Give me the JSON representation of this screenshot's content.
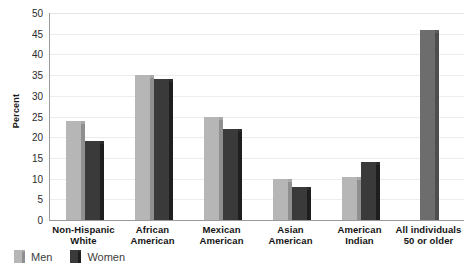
{
  "chart_data": {
    "type": "bar",
    "title": "",
    "xlabel": "",
    "ylabel": "Percent",
    "ylim": [
      0,
      50
    ],
    "yticks": [
      50,
      45,
      40,
      35,
      30,
      25,
      20,
      15,
      10,
      5,
      0
    ],
    "grid": true,
    "legend_position": "bottom-left",
    "categories": [
      "Non-Hispanic\nWhite",
      "African\nAmerican",
      "Mexican\nAmerican",
      "Asian\nAmerican",
      "American\nIndian",
      "All individuals\n50 or older"
    ],
    "category_lines": [
      [
        "Non-Hispanic",
        "White"
      ],
      [
        "African",
        "American"
      ],
      [
        "Mexican",
        "American"
      ],
      [
        "Asian",
        "American"
      ],
      [
        "American",
        "Indian"
      ],
      [
        "All individuals",
        "50 or older"
      ]
    ],
    "series": [
      {
        "name": "Men",
        "color": "#b6b6b6",
        "values": [
          24,
          35,
          25,
          10,
          10.5,
          null
        ]
      },
      {
        "name": "Women",
        "color": "#3a3a3a",
        "values": [
          19,
          34,
          22,
          8,
          14,
          null
        ]
      },
      {
        "name": "All",
        "color": "#6d6d6d",
        "values": [
          null,
          null,
          null,
          null,
          null,
          46
        ]
      }
    ],
    "legend": [
      {
        "label": "Men",
        "color": "#b6b6b6"
      },
      {
        "label": "Women",
        "color": "#3a3a3a"
      }
    ],
    "colors": {
      "men": "#b6b6b6",
      "women": "#3a3a3a",
      "all": "#6d6d6d",
      "grid": "#ededed",
      "axis": "#9a9a9a",
      "text": "#141414",
      "background": "#ffffff"
    }
  }
}
